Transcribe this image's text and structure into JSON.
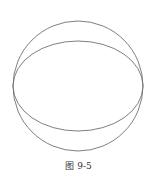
{
  "diagram": {
    "caption": "图 9-5",
    "stroke_color": "#707070",
    "shapes": [
      {
        "type": "circle",
        "name": "sphere-outline",
        "cx": 78,
        "cy": 86,
        "r": 65
      },
      {
        "type": "ellipse",
        "name": "equator-ellipse",
        "cx": 78,
        "cy": 86,
        "rx": 65,
        "ry": 45
      }
    ]
  }
}
